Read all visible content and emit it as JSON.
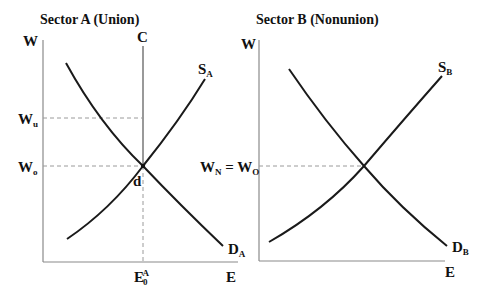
{
  "panels": [
    {
      "title": "Sector A (Union)",
      "y_axis_label": "W",
      "x_axis_label": "E",
      "vertical_line_label": "C",
      "supply_label": {
        "main": "S",
        "sub": "A"
      },
      "demand_label": {
        "main": "D",
        "sub": "A"
      },
      "wage_levels": [
        {
          "main": "W",
          "sub": "u",
          "description": "union wage"
        },
        {
          "main": "W",
          "sub": "o",
          "description": "equilibrium wage"
        }
      ],
      "point_label": "d",
      "x_tick_label": {
        "main": "E",
        "sub": "0",
        "sup": "A"
      }
    },
    {
      "title": "Sector B (Nonunion)",
      "y_axis_label": "W",
      "x_axis_label": "E",
      "supply_label": {
        "main": "S",
        "sub": "B"
      },
      "demand_label": {
        "main": "D",
        "sub": "B"
      },
      "wage_levels": [
        {
          "main": "W",
          "sub": "N",
          "eq": " = ",
          "main2": "W",
          "sub2": "O"
        }
      ]
    }
  ],
  "colors": {
    "curve": "#1a1a1a",
    "axis": "#8a8a8a",
    "dashed": "#9a9a9a",
    "text": "#111111"
  }
}
